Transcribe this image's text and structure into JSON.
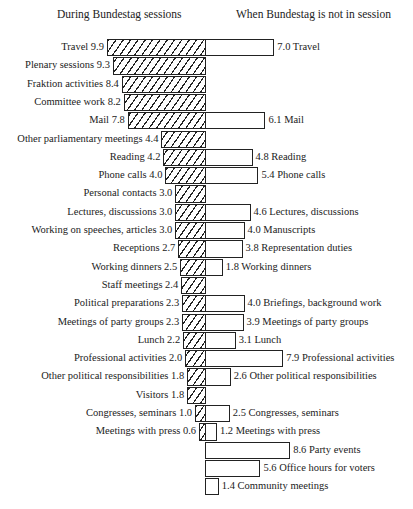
{
  "headers": {
    "left": "During Bundestag sessions",
    "right": "When Bundestag is not in session"
  },
  "chart_data": {
    "type": "bar",
    "orientation": "horizontal-butterfly",
    "title": "",
    "xlabel": "",
    "ylabel": "",
    "grid": false,
    "legend": "none",
    "series": [
      {
        "name": "During Bundestag sessions",
        "side": "left",
        "fill": "hatched"
      },
      {
        "name": "When Bundestag is not in session",
        "side": "right",
        "fill": "white"
      }
    ],
    "rows": [
      {
        "left_label": "Travel",
        "left": 9.9,
        "right_label": "Travel",
        "right": 7.0
      },
      {
        "left_label": "Plenary sessions",
        "left": 9.3,
        "right_label": "",
        "right": null
      },
      {
        "left_label": "Fraktion activities",
        "left": 8.4,
        "right_label": "",
        "right": null
      },
      {
        "left_label": "Committee work",
        "left": 8.2,
        "right_label": "",
        "right": null
      },
      {
        "left_label": "Mail",
        "left": 7.8,
        "right_label": "Mail",
        "right": 6.1
      },
      {
        "left_label": "Other parliamentary meetings",
        "left": 4.4,
        "right_label": "",
        "right": null
      },
      {
        "left_label": "Reading",
        "left": 4.2,
        "right_label": "Reading",
        "right": 4.8
      },
      {
        "left_label": "Phone calls",
        "left": 4.0,
        "right_label": "Phone calls",
        "right": 5.4
      },
      {
        "left_label": "Personal contacts",
        "left": 3.0,
        "right_label": "",
        "right": null
      },
      {
        "left_label": "Lectures, discussions",
        "left": 3.0,
        "right_label": "Lectures, discussions",
        "right": 4.6
      },
      {
        "left_label": "Working on speeches, articles",
        "left": 3.0,
        "right_label": "Manuscripts",
        "right": 4.0
      },
      {
        "left_label": "Receptions",
        "left": 2.7,
        "right_label": "Representation duties",
        "right": 3.8
      },
      {
        "left_label": "Working dinners",
        "left": 2.5,
        "right_label": "Working dinners",
        "right": 1.8
      },
      {
        "left_label": "Staff meetings",
        "left": 2.4,
        "right_label": "",
        "right": null
      },
      {
        "left_label": "Political preparations",
        "left": 2.3,
        "right_label": "Briefings, background work",
        "right": 4.0
      },
      {
        "left_label": "Meetings of party groups",
        "left": 2.3,
        "right_label": "Meetings of party groups",
        "right": 3.9
      },
      {
        "left_label": "Lunch",
        "left": 2.2,
        "right_label": "Lunch",
        "right": 3.1
      },
      {
        "left_label": "Professional activities",
        "left": 2.0,
        "right_label": "Professional activities",
        "right": 7.9
      },
      {
        "left_label": "Other political responsibilities",
        "left": 1.8,
        "right_label": "Other political responsibilities",
        "right": 2.6
      },
      {
        "left_label": "Visitors",
        "left": 1.8,
        "right_label": "",
        "right": null
      },
      {
        "left_label": "Congresses, seminars",
        "left": 1.0,
        "right_label": "Congresses, seminars",
        "right": 2.5
      },
      {
        "left_label": "Meetings with press",
        "left": 0.6,
        "right_label": "Meetings with press",
        "right": 1.2
      },
      {
        "left_label": "",
        "left": null,
        "right_label": "Party events",
        "right": 8.6
      },
      {
        "left_label": "",
        "left": null,
        "right_label": "Office hours for voters",
        "right": 5.6
      },
      {
        "left_label": "",
        "left": null,
        "right_label": "Community meetings",
        "right": 1.4
      }
    ]
  }
}
